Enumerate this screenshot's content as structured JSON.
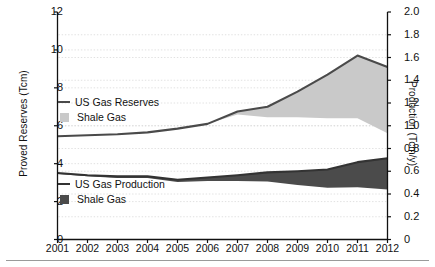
{
  "chart_data": {
    "type": "area",
    "title": "",
    "xlabel": "",
    "ylabel": "Proved Reserves (Tcm)",
    "y2label": "Production (Tcm/y)",
    "grid": true,
    "legend_position": "inside-left",
    "x": [
      2001,
      2002,
      2003,
      2004,
      2005,
      2006,
      2007,
      2008,
      2009,
      2010,
      2011,
      2012
    ],
    "categories": [
      "2001",
      "2002",
      "2003",
      "2004",
      "2005",
      "2006",
      "2007",
      "2008",
      "2009",
      "2010",
      "2011",
      "2012"
    ],
    "xtick_labels": [
      "2001",
      "2002",
      "2003",
      "2004",
      "2005",
      "2006",
      "2007",
      "2008",
      "2009",
      "2010",
      "2011",
      "2012"
    ],
    "ylim": [
      0,
      12
    ],
    "ytick_labels": [
      "0",
      "2",
      "4",
      "6",
      "8",
      "10",
      "12"
    ],
    "ytick_values": [
      0,
      2,
      4,
      6,
      8,
      10,
      12
    ],
    "y2lim": [
      0,
      2.0
    ],
    "y2tick_labels": [
      "0",
      "0.2",
      "0.4",
      "0.6",
      "0.8",
      "1.0",
      "1.2",
      "1.4",
      "1.6",
      "1.8",
      "2.0"
    ],
    "y2tick_values": [
      0,
      0.2,
      0.4,
      0.6,
      0.8,
      1.0,
      1.2,
      1.4,
      1.6,
      1.8,
      2.0
    ],
    "series": [
      {
        "name": "US Gas Reserves",
        "axis": "left",
        "units": "Tcm",
        "type": "line",
        "color": "#4a4a4a",
        "values": [
          5.45,
          5.5,
          5.55,
          5.65,
          5.85,
          6.1,
          6.75,
          7.0,
          7.8,
          8.7,
          9.7,
          9.1
        ]
      },
      {
        "name": "Shale Gas",
        "axis": "left",
        "units": "Tcm",
        "type": "area",
        "color": "#c9c9c9",
        "description": "Shale share of US gas reserves, shaded band between total reserves line and non-shale reserves",
        "values": [
          0.0,
          0.0,
          0.0,
          0.0,
          0.0,
          0.0,
          0.15,
          0.55,
          1.35,
          2.3,
          3.3,
          3.5
        ],
        "base_values": [
          5.45,
          5.5,
          5.55,
          5.65,
          5.85,
          6.1,
          6.6,
          6.45,
          6.45,
          6.4,
          6.4,
          5.6
        ]
      },
      {
        "name": "US Gas Production",
        "axis": "right",
        "units": "Tcm/y",
        "type": "line",
        "color": "#333333",
        "values": [
          0.585,
          0.565,
          0.555,
          0.555,
          0.525,
          0.545,
          0.565,
          0.59,
          0.6,
          0.615,
          0.68,
          0.715
        ]
      },
      {
        "name": "Shale Gas",
        "axis": "right",
        "units": "Tcm/y",
        "type": "area",
        "color": "#4b4b4b",
        "description": "Shale share of US gas production, shaded band below the total production line",
        "values": [
          0.01,
          0.01,
          0.015,
          0.015,
          0.02,
          0.03,
          0.05,
          0.08,
          0.12,
          0.16,
          0.22,
          0.275
        ],
        "base_values": [
          0.575,
          0.555,
          0.54,
          0.54,
          0.505,
          0.515,
          0.515,
          0.51,
          0.48,
          0.455,
          0.46,
          0.44
        ]
      }
    ]
  },
  "legend": {
    "reserves": {
      "line_label": "US Gas Reserves",
      "area_label": "Shale Gas"
    },
    "production": {
      "line_label": "US Gas Production",
      "area_label": "Shale Gas"
    }
  },
  "colors": {
    "reserves_line": "#4a4a4a",
    "reserves_shale_fill": "#c9c9c9",
    "production_line": "#333333",
    "production_shale_fill": "#4b4b4b",
    "axis": "#111111",
    "grid": "#d9d9d9"
  }
}
